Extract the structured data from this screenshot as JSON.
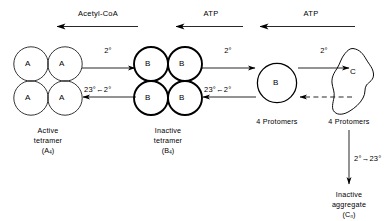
{
  "diagram": {
    "background_color": "#ffffff",
    "ink_color": "#000000",
    "degree_symbol": "°"
  },
  "top_arrows": [
    {
      "label": "Acetyl-CoA",
      "direction": "left"
    },
    {
      "label": "ATP",
      "direction": "left"
    },
    {
      "label": "ATP",
      "direction": "left"
    }
  ],
  "species": [
    {
      "id": "a4",
      "kind": "tetramer",
      "subunit_letter": "A",
      "subunit_count": 4,
      "stroke": "thin",
      "caption_lines": [
        "Active",
        "tetramer"
      ],
      "formula_prefix": "(A",
      "formula_sub": "4",
      "formula_suffix": ")"
    },
    {
      "id": "b4",
      "kind": "tetramer",
      "subunit_letter": "B",
      "subunit_count": 4,
      "stroke": "thick",
      "caption_lines": [
        "Inactive",
        "tetramer"
      ],
      "formula_prefix": "(B",
      "formula_sub": "4",
      "formula_suffix": ")"
    },
    {
      "id": "b1",
      "kind": "monomer",
      "subunit_letter": "B",
      "subunit_count": 1,
      "stroke": "medium",
      "caption_lines": [
        "4 Protomers"
      ],
      "formula_prefix": "",
      "formula_sub": "",
      "formula_suffix": ""
    },
    {
      "id": "c",
      "kind": "aggregate-blob",
      "subunit_letter": "C",
      "subunit_count": 1,
      "stroke": "thin",
      "caption_lines": [
        "4 Protomers"
      ],
      "formula_prefix": "",
      "formula_sub": "",
      "formula_suffix": ""
    }
  ],
  "reaction_arrows": [
    {
      "id": "a4-to-b4",
      "label": "2°",
      "direction": "right",
      "style": "solid"
    },
    {
      "id": "b4-to-a4",
      "label_left": "23°",
      "label_arrow": "←",
      "label_right": "2°",
      "direction": "left",
      "style": "solid"
    },
    {
      "id": "b4-to-b1",
      "label": "2°",
      "direction": "right",
      "style": "solid"
    },
    {
      "id": "b1-to-b4",
      "label_left": "23°",
      "label_arrow": "←",
      "label_right": "2°",
      "direction": "left",
      "style": "solid"
    },
    {
      "id": "b1-to-c",
      "label": "2°",
      "direction": "right",
      "style": "solid"
    },
    {
      "id": "c-to-b1",
      "label": "",
      "direction": "left",
      "style": "dashed"
    }
  ],
  "vertical_arrow": {
    "id": "c-to-aggregate",
    "label": "2°→23°",
    "direction": "down",
    "style": "solid"
  },
  "final_product": {
    "caption_lines": [
      "Inactive",
      "aggregate"
    ],
    "formula_prefix": "(C",
    "formula_sub": "n",
    "formula_suffix": ")"
  }
}
